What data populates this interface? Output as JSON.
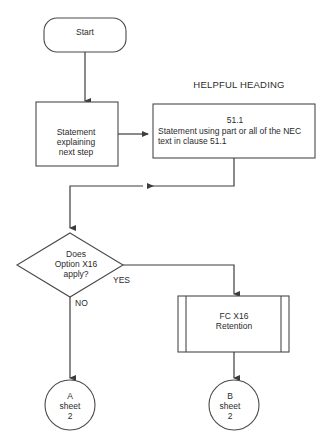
{
  "diagram": {
    "colors": {
      "stroke": "#4a4a4a",
      "connector": "#3c3c3c",
      "text": "#2b2b2b",
      "background": "#ffffff"
    },
    "nodes": {
      "start": {
        "label": "Start",
        "shape": "terminator-rounded-rectangle"
      },
      "heading": {
        "label": "HELPFUL HEADING",
        "shape": "free-text"
      },
      "process_left": {
        "label": "Statement\nexplaining\nnext step",
        "shape": "process-rectangle"
      },
      "process_right": {
        "clause_number": "51.1",
        "body": "Statement using part or all of the NEC\ntext in clause 51.1",
        "shape": "process-rectangle"
      },
      "decision": {
        "label": "Does\nOption X16\napply?",
        "shape": "decision-diamond"
      },
      "predefined": {
        "label": "FC X16\nRetention",
        "shape": "predefined-process"
      },
      "connector_a": {
        "label": "A\nsheet\n2",
        "shape": "off-page-connector-circle"
      },
      "connector_b": {
        "label": "B\nsheet\n2",
        "shape": "off-page-connector-circle"
      }
    },
    "edges": {
      "start_to_process": {
        "label": ""
      },
      "process_to_clause": {
        "label": ""
      },
      "clause_to_merge": {
        "label": ""
      },
      "merge_to_decision": {
        "label": ""
      },
      "decision_yes": {
        "label": "YES"
      },
      "decision_no": {
        "label": "NO"
      },
      "predefined_to_b": {
        "label": ""
      },
      "no_to_a": {
        "label": ""
      }
    }
  }
}
